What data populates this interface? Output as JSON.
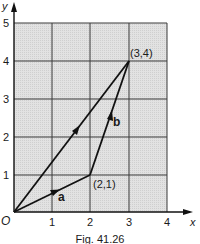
{
  "diagram": {
    "axes": {
      "x_label": "x",
      "y_label": "y",
      "origin_label": "O",
      "x_ticks": [
        "1",
        "2",
        "3",
        "4"
      ],
      "y_ticks": [
        "1",
        "2",
        "3",
        "4",
        "5"
      ]
    },
    "points": {
      "p1": "(2,1)",
      "p2": "(3,4)"
    },
    "vectors": {
      "a": "a",
      "b": "b"
    },
    "caption": "Fig. 41.26",
    "colors": {
      "grid_fill": "#dcdcdc",
      "grid_line": "#3a3a3a",
      "ink": "#111111"
    }
  }
}
